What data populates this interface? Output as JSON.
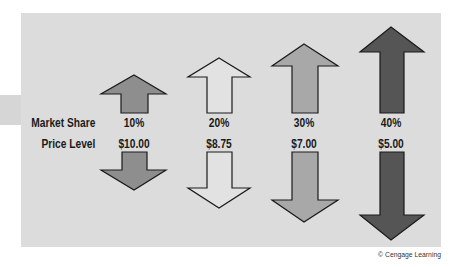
{
  "figure": {
    "row_labels": {
      "market_share": "Market Share",
      "price_level": "Price Level"
    },
    "columns": [
      {
        "market_share": "10%",
        "price_level": "$10.00",
        "arrow_color": "#8e8e8e"
      },
      {
        "market_share": "20%",
        "price_level": "$8.75",
        "arrow_color": "#e2e2e2"
      },
      {
        "market_share": "30%",
        "price_level": "$7.00",
        "arrow_color": "#a8a8a8"
      },
      {
        "market_share": "40%",
        "price_level": "$5.00",
        "arrow_color": "#555555"
      }
    ],
    "panel_color": "#dcdcdc",
    "copyright": "© Cengage Learning"
  },
  "icons": {
    "up_arrow": "arrow-up-icon",
    "down_arrow": "arrow-down-icon"
  }
}
